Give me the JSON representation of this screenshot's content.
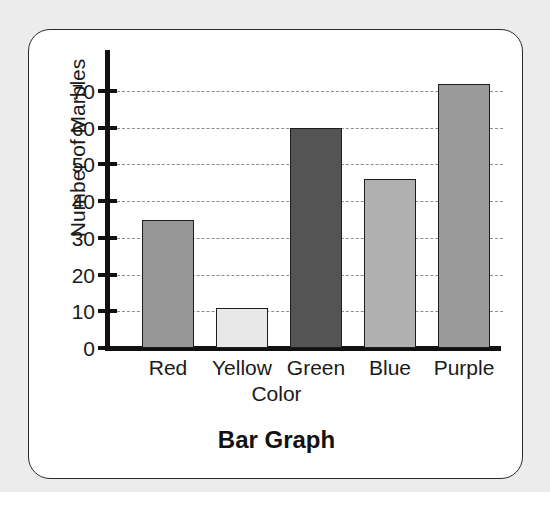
{
  "chart_data": {
    "type": "bar",
    "title": "Bar Graph",
    "xlabel": "Color",
    "ylabel": "Number of Marbles",
    "categories": [
      "Red",
      "Yellow",
      "Green",
      "Blue",
      "Purple"
    ],
    "values": [
      35,
      11,
      60,
      46,
      72
    ],
    "ylim": [
      0,
      78
    ],
    "yticks": [
      0,
      10,
      20,
      30,
      40,
      50,
      60,
      70
    ],
    "ytick_labels": [
      "0",
      "10",
      "20",
      "30",
      "40",
      "50",
      "60",
      "70"
    ],
    "grid": "horizontal-dashed",
    "legend": "none",
    "bar_colors": [
      "#969696",
      "#e8e8e8",
      "#545454",
      "#b0b0b0",
      "#9a9a9a"
    ],
    "bar_edge_color": "#1d1d1d",
    "axis_color": "#111111",
    "gridline_color": "#8e8e8e",
    "series": [
      {
        "name": "Number of Marbles",
        "points": [
          {
            "category": "Red",
            "value": 35
          },
          {
            "category": "Yellow",
            "value": 11
          },
          {
            "category": "Green",
            "value": 60
          },
          {
            "category": "Blue",
            "value": 46
          },
          {
            "category": "Purple",
            "value": 72
          }
        ]
      }
    ]
  },
  "card": {
    "background": "#ffffff",
    "border_color": "#2b2b2b"
  },
  "page": {
    "background": "#ececed"
  }
}
